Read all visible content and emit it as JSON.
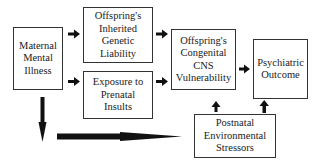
{
  "diagram": {
    "nodes": [
      {
        "id": "maternal",
        "label": "Maternal\nMental\nIllness"
      },
      {
        "id": "genetic",
        "label": "Offspring's\nInherited\nGenetic\nLiability"
      },
      {
        "id": "prenatal",
        "label": "Exposure to\nPrenatal\nInsults"
      },
      {
        "id": "cns",
        "label": "Offspring's\nCongenital\nCNS\nVulnerability"
      },
      {
        "id": "outcome",
        "label": "Psychiatric\nOutcome"
      },
      {
        "id": "postnatal",
        "label": "Postnatal\nEnvironmental\nStressors"
      }
    ],
    "edges": [
      {
        "from": "maternal",
        "to": "genetic"
      },
      {
        "from": "maternal",
        "to": "prenatal"
      },
      {
        "from": "genetic",
        "to": "cns"
      },
      {
        "from": "prenatal",
        "to": "cns"
      },
      {
        "from": "cns",
        "to": "outcome"
      },
      {
        "from": "postnatal",
        "to": "cns"
      },
      {
        "from": "postnatal",
        "to": "outcome"
      },
      {
        "from": "maternal",
        "to": "postnatal"
      }
    ],
    "colors": {
      "line": "#333333",
      "arrow": "#111111",
      "background": "#ffffff"
    }
  }
}
